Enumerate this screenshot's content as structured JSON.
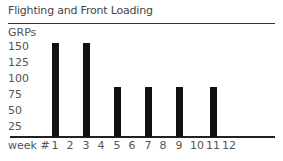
{
  "chart_data": {
    "type": "bar",
    "title": "Flighting and Front Loading",
    "xlabel": "week #",
    "ylabel": "GRPs",
    "categories": [
      "1",
      "2",
      "3",
      "4",
      "5",
      "6",
      "7",
      "8",
      "9",
      "10",
      "11",
      "12"
    ],
    "values": [
      160,
      0,
      160,
      0,
      85,
      0,
      85,
      0,
      85,
      0,
      85,
      0
    ],
    "yticks": [
      "150",
      "125",
      "100",
      "75",
      "50",
      "25"
    ],
    "ylim": [
      0,
      170
    ],
    "grid": false,
    "legend": null
  }
}
